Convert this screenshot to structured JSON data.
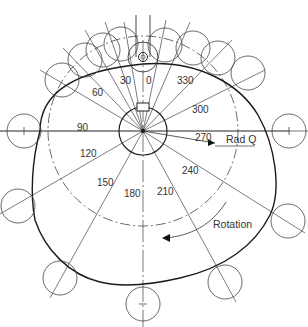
{
  "diagram": {
    "type": "cam-profile",
    "center": [
      143,
      131
    ],
    "hub_radius": 24,
    "base_circle_radius": 95,
    "colors": {
      "line": "#333333",
      "profile": "#1a1a1a",
      "background": "#ffffff"
    },
    "angle_labels": [
      {
        "text": "0",
        "x": 146,
        "y": 84
      },
      {
        "text": "30",
        "x": 120,
        "y": 84
      },
      {
        "text": "60",
        "x": 92,
        "y": 96
      },
      {
        "text": "90",
        "x": 77,
        "y": 131
      },
      {
        "text": "120",
        "x": 80,
        "y": 157
      },
      {
        "text": "150",
        "x": 97,
        "y": 186
      },
      {
        "text": "180",
        "x": 124,
        "y": 197
      },
      {
        "text": "210",
        "x": 157,
        "y": 195
      },
      {
        "text": "240",
        "x": 182,
        "y": 174
      },
      {
        "text": "270",
        "x": 195,
        "y": 141
      },
      {
        "text": "300",
        "x": 192,
        "y": 113
      },
      {
        "text": "330",
        "x": 177,
        "y": 84
      }
    ],
    "annotations": {
      "radius_label": "Rad Q",
      "rotation_label": "Rotation"
    }
  }
}
